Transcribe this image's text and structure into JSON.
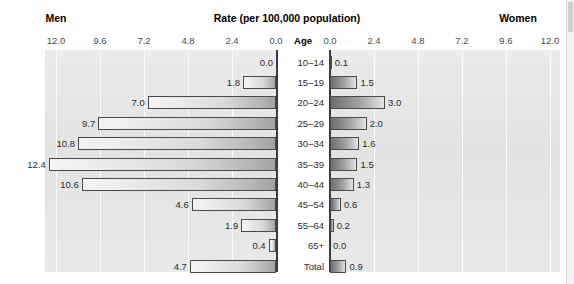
{
  "header": {
    "left_title": "Men",
    "center_title": "Rate (per 100,000 population)",
    "right_title": "Women",
    "age_column_header": "Age"
  },
  "axis": {
    "left_ticks": [
      "12.0",
      "9.6",
      "7.2",
      "4.8",
      "2.4",
      "0.0"
    ],
    "right_ticks": [
      "0.0",
      "2.4",
      "4.8",
      "7.2",
      "9.6",
      "12.0"
    ]
  },
  "chart_data": {
    "type": "bar",
    "title": "Rate (per 100,000 population)",
    "subtype": "population-pyramid",
    "orientation": "horizontal-diverging",
    "xlabel": "Rate (per 100,000 population)",
    "ylabel": "Age",
    "xlim": [
      0,
      12
    ],
    "xticks": [
      0.0,
      2.4,
      4.8,
      7.2,
      9.6,
      12.0
    ],
    "grid": true,
    "legend": false,
    "categories": [
      "10–14",
      "15–19",
      "20–24",
      "25–29",
      "30–34",
      "35–39",
      "40–44",
      "45–54",
      "55–64",
      "65+",
      "Total"
    ],
    "series": [
      {
        "name": "Men",
        "side": "left",
        "values": [
          0.0,
          1.8,
          7.0,
          9.7,
          10.8,
          12.4,
          10.6,
          4.6,
          1.9,
          0.4,
          4.7
        ],
        "labels": [
          "0.0",
          "1.8",
          "7.0",
          "9.7",
          "10.8",
          "12.4",
          "10.6",
          "4.6",
          "1.9",
          "0.4",
          "4.7"
        ]
      },
      {
        "name": "Women",
        "side": "right",
        "values": [
          0.1,
          1.5,
          3.0,
          2.0,
          1.6,
          1.5,
          1.3,
          0.6,
          0.2,
          0.0,
          0.9
        ],
        "labels": [
          "0.1",
          "1.5",
          "3.0",
          "2.0",
          "1.6",
          "1.5",
          "1.3",
          "0.6",
          "0.2",
          "0.0",
          "0.9"
        ]
      }
    ],
    "colors": {
      "men_bar_light": "#f4f4f4",
      "men_bar_dark": "#a2a2a2",
      "women_bar_dark": "#6f6f6f",
      "women_bar_light": "#e4e4e4",
      "plot_background": "#e6e6e6",
      "gridline": "#fbfbfb",
      "axis": "#3a3a3a",
      "text": "#2b2b2b"
    }
  }
}
